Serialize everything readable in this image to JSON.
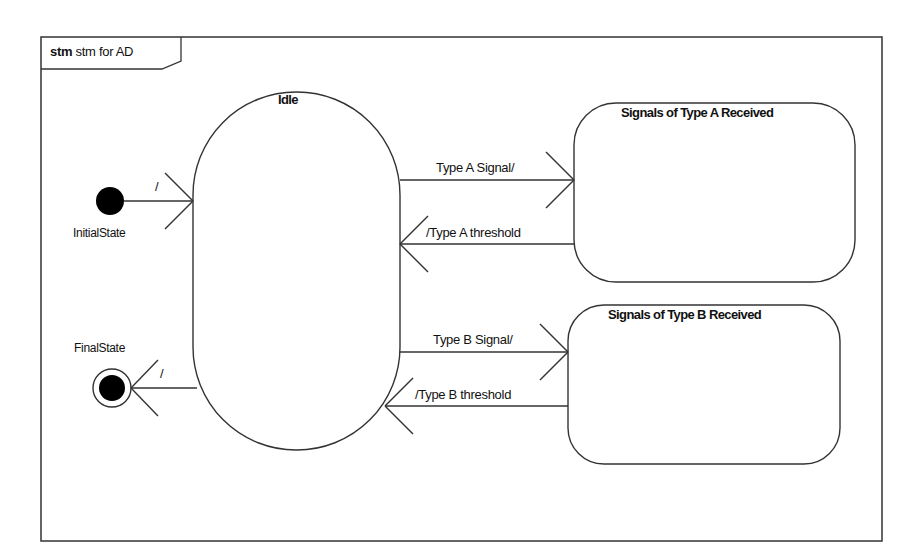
{
  "frame": {
    "keyword": "stm",
    "name": "stm for AD"
  },
  "states": {
    "idle": {
      "label": "Idle"
    },
    "type_a": {
      "label": "Signals of Type A Received"
    },
    "type_b": {
      "label": "Signals of Type B Received"
    },
    "initial": {
      "label": "InitialState"
    },
    "final": {
      "label": "FinalState"
    }
  },
  "transitions": {
    "initial_to_idle": "/",
    "idle_to_final": "/",
    "idle_to_a": "Type A Signal/",
    "a_to_idle": "/Type A threshold",
    "idle_to_b": "Type B Signal/",
    "b_to_idle": "/Type B threshold"
  },
  "colors": {
    "line": "#333333",
    "fill": "#ffffff",
    "node": "#000000"
  }
}
